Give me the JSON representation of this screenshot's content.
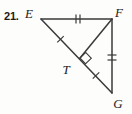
{
  "figure": {
    "problem_number": "21.",
    "shape_type": "triangle-with-altitude",
    "stroke_color": "#3a3a3a",
    "label_color": "#1a1a1a",
    "background_color": "#fdfdfc",
    "vertices": [
      {
        "name": "E",
        "label": "E",
        "x": 41,
        "y": 19,
        "label_x": 31,
        "label_y": 15
      },
      {
        "name": "F",
        "label": "F",
        "x": 112,
        "y": 19,
        "label_x": 113,
        "label_y": 14
      },
      {
        "name": "G",
        "label": "G",
        "x": 112,
        "y": 93,
        "label_x": 113,
        "label_y": 105
      },
      {
        "name": "T",
        "label": "T",
        "x": 80,
        "y": 58,
        "label_x": 63,
        "label_y": 70
      }
    ],
    "segments": [
      {
        "name": "segment-EF",
        "from": "E",
        "to": "F",
        "ticks": 2
      },
      {
        "name": "segment-FG",
        "from": "F",
        "to": "G",
        "ticks": 2
      },
      {
        "name": "segment-EG",
        "from": "E",
        "to": "G",
        "ticks": 0
      },
      {
        "name": "segment-FT",
        "from": "F",
        "to": "T",
        "ticks": 0
      },
      {
        "name": "segment-ET",
        "from": "E",
        "to": "T",
        "ticks": 1
      },
      {
        "name": "segment-TG",
        "from": "T",
        "to": "G",
        "ticks": 1
      }
    ],
    "right_angle": {
      "at": "T",
      "between": [
        "F",
        "G"
      ],
      "marker": "square"
    },
    "tick_marks": [
      {
        "name": "tick-EF",
        "on": "EF",
        "count": 2,
        "x": 78,
        "y": 19
      },
      {
        "name": "tick-FG",
        "on": "FG",
        "count": 2,
        "x": 112,
        "y": 58
      },
      {
        "name": "tick-ET",
        "on": "ET",
        "count": 1,
        "x": 61,
        "y": 38
      },
      {
        "name": "tick-TG",
        "on": "TG",
        "count": 1,
        "x": 96,
        "y": 76
      }
    ]
  }
}
